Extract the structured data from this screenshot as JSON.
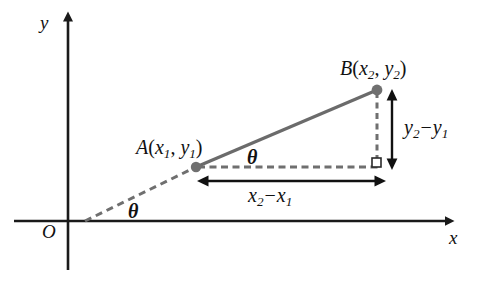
{
  "diagram": {
    "axes": {
      "x_label": "x",
      "y_label": "y",
      "origin_label": "O",
      "x_axis_y": 221,
      "y_axis_x": 68
    },
    "points": [
      {
        "id": "A",
        "label_name": "A",
        "label_open": "(",
        "label_x_var": "x",
        "label_x_sub": "1",
        "label_comma": ", ",
        "label_y_var": "y",
        "label_y_sub": "1",
        "label_close": ")",
        "label_full": "A(x1, y1)",
        "cx": 196,
        "cy": 167
      },
      {
        "id": "B",
        "label_name": "B",
        "label_open": "(",
        "label_x_var": "x",
        "label_x_sub": "2",
        "label_comma": ", ",
        "label_y_var": "y",
        "label_y_sub": "2",
        "label_close": ")",
        "label_full": "B(x2, y2)",
        "cx": 377,
        "cy": 90
      }
    ],
    "angles": [
      {
        "id": "theta-lower",
        "label": "θ",
        "x": 134,
        "y": 211
      },
      {
        "id": "theta-upper",
        "label": "θ",
        "x": 253,
        "y": 157
      }
    ],
    "measurements": [
      {
        "id": "delta-x",
        "var": "x",
        "sub_2": "2",
        "minus": "−",
        "sub_1": "1",
        "label_full": "x2 - x1",
        "orientation": "horizontal",
        "from": 208,
        "to": 375,
        "axis_pos": 181
      },
      {
        "id": "delta-y",
        "var": "y",
        "sub_2": "2",
        "minus": "−",
        "sub_1": "1",
        "label_full": "y2 - y1",
        "orientation": "vertical",
        "from": 98,
        "to": 160,
        "axis_pos": 392
      }
    ],
    "right_angle": {
      "x": 372,
      "y": 158,
      "size": 9
    },
    "ray_from_origin": {
      "x1": 85,
      "y1": 221,
      "x2": 196,
      "y2": 167
    },
    "colors": {
      "axis": "#1a1a1a",
      "geometry_line": "#6b6b6b",
      "dash": "#6f6f6f",
      "point_fill": "#707070",
      "arrow": "#111111",
      "text": "#111111",
      "background": "#ffffff"
    }
  }
}
